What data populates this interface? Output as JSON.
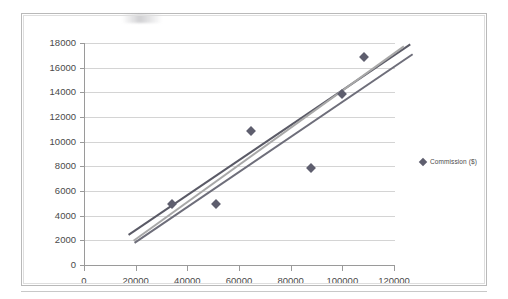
{
  "chart_data": {
    "type": "scatter",
    "title": "",
    "xlabel": "",
    "ylabel": "",
    "xlim": [
      0,
      120000
    ],
    "ylim": [
      0,
      18000
    ],
    "grid": true,
    "legend_position": "right",
    "x_ticks": [
      "0",
      "20000",
      "40000",
      "60000",
      "80000",
      "100000",
      "120000"
    ],
    "x_tick_values": [
      0,
      20000,
      40000,
      60000,
      80000,
      100000,
      120000
    ],
    "y_ticks": [
      "0",
      "2000",
      "4000",
      "6000",
      "8000",
      "10000",
      "12000",
      "14000",
      "16000",
      "18000"
    ],
    "y_tick_values": [
      0,
      2000,
      4000,
      6000,
      8000,
      10000,
      12000,
      14000,
      16000,
      18000
    ],
    "series": [
      {
        "name": "Commission ($)",
        "type": "scatter",
        "marker": "diamond",
        "color": "#5e5e6e",
        "points": [
          {
            "x": 34000,
            "y": 4950
          },
          {
            "x": 51000,
            "y": 4930
          },
          {
            "x": 64500,
            "y": 10900
          },
          {
            "x": 88000,
            "y": 7900
          },
          {
            "x": 100000,
            "y": 13900
          },
          {
            "x": 108500,
            "y": 16900
          }
        ]
      }
    ],
    "trendlines": [
      {
        "name": "trendline-steep",
        "color": "#5a5a66",
        "x0": 17000,
        "y0": 2520,
        "x1": 126000,
        "y1": 17950
      },
      {
        "name": "trendline-mid",
        "color": "#a8a8a8",
        "x0": 19000,
        "y0": 2050,
        "x1": 123500,
        "y1": 17800
      },
      {
        "name": "trendline-shallow",
        "color": "#6e6e7a",
        "x0": 19500,
        "y0": 1880,
        "x1": 127000,
        "y1": 17150
      }
    ]
  },
  "legend": {
    "entries": [
      {
        "label": "Commission ($)",
        "marker": "diamond",
        "color": "#5e5e6e"
      }
    ]
  },
  "colors": {
    "marker": "#5e5e6e",
    "gridline": "#d4d4d4",
    "axis": "#9a9a9a",
    "frame": "#b9b9b9",
    "background": "#ffffff",
    "tick_text": "#4a4a4a"
  }
}
